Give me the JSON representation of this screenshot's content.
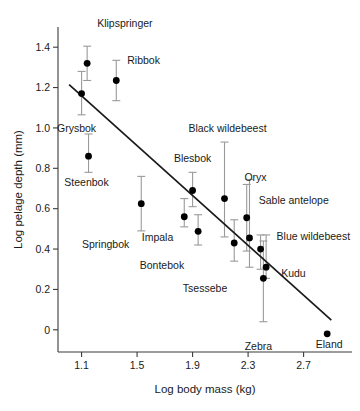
{
  "chart_data": {
    "type": "scatter",
    "title": "",
    "subtitle": "",
    "xlabel": "Log body mass (kg)",
    "ylabel": "Log pelage depth (mm)",
    "xlim": [
      0.93,
      3.02
    ],
    "ylim": [
      -0.11,
      1.5
    ],
    "xticks": [
      1.1,
      1.5,
      1.9,
      2.3,
      2.7
    ],
    "xtick_labels": [
      "1.1",
      "1.5",
      "1.9",
      "2.3",
      "2.7"
    ],
    "yticks": [
      0,
      0.2,
      0.4,
      0.6,
      0.8,
      1.0,
      1.2,
      1.4
    ],
    "ytick_labels": [
      "0",
      "0.2",
      "0.4",
      "0.6",
      "0.8",
      "1.0",
      "1.2",
      "1.4"
    ],
    "grid": false,
    "legend": "none",
    "error_bars": "vertical",
    "points": [
      {
        "label": "Klipspringer",
        "x": 1.14,
        "y": 1.32,
        "ylow": 1.235,
        "yhigh": 1.405,
        "label_dx": 10,
        "label_dy": -36,
        "label_anchor": "start"
      },
      {
        "label": "Grysbok",
        "x": 1.1,
        "y": 1.17,
        "ylow": 1.065,
        "yhigh": 1.28,
        "label_dx": -5,
        "label_dy": 38,
        "label_anchor": "middle"
      },
      {
        "label": "Ribbok",
        "x": 1.35,
        "y": 1.235,
        "ylow": 1.135,
        "yhigh": 1.335,
        "label_dx": 11,
        "label_dy": -16,
        "label_anchor": "start"
      },
      {
        "label": "Steenbok",
        "x": 1.15,
        "y": 0.86,
        "ylow": 0.78,
        "yhigh": 0.97,
        "label_dx": -2,
        "label_dy": 30,
        "label_anchor": "middle"
      },
      {
        "label": "Springbok",
        "x": 1.53,
        "y": 0.625,
        "ylow": 0.49,
        "yhigh": 0.76,
        "label_dx": -12,
        "label_dy": 44,
        "label_anchor": "end"
      },
      {
        "label": "Impala",
        "x": 1.84,
        "y": 0.56,
        "ylow": 0.51,
        "yhigh": 0.65,
        "label_dx": -11,
        "label_dy": 24,
        "label_anchor": "end"
      },
      {
        "label": "Blesbok",
        "x": 1.9,
        "y": 0.69,
        "ylow": 0.61,
        "yhigh": 0.78,
        "label_dx": 0,
        "label_dy": -29,
        "label_anchor": "middle"
      },
      {
        "label": "Bontebok",
        "x": 1.94,
        "y": 0.488,
        "ylow": 0.42,
        "yhigh": 0.57,
        "label_dx": -14,
        "label_dy": 38,
        "label_anchor": "end"
      },
      {
        "label": "Black wildebeest",
        "x": 2.13,
        "y": 0.65,
        "ylow": 0.46,
        "yhigh": 0.93,
        "label_dx": 3,
        "label_dy": -67,
        "label_anchor": "middle"
      },
      {
        "label": "Tsessebe",
        "x": 2.2,
        "y": 0.43,
        "ylow": 0.34,
        "yhigh": 0.545,
        "label_dx": -7,
        "label_dy": 49,
        "label_anchor": "end"
      },
      {
        "label": "Oryx",
        "x": 2.31,
        "y": 0.455,
        "ylow": 0.31,
        "yhigh": 0.745,
        "label_dx": 6,
        "label_dy": -57,
        "label_anchor": "middle"
      },
      {
        "label": "Sable antelope",
        "x": 2.29,
        "y": 0.555,
        "ylow": 0.39,
        "yhigh": 0.72,
        "label_dx": 12,
        "label_dy": -14,
        "label_anchor": "start"
      },
      {
        "label": "Blue wildebeest",
        "x": 2.39,
        "y": 0.4,
        "ylow": 0.3,
        "yhigh": 0.47,
        "label_dx": 16,
        "label_dy": -9,
        "label_anchor": "start"
      },
      {
        "label": "Kudu",
        "x": 2.43,
        "y": 0.31,
        "ylow": 0.255,
        "yhigh": 0.47,
        "label_dx": 15,
        "label_dy": 10,
        "label_anchor": "start"
      },
      {
        "label": "Zebra",
        "x": 2.41,
        "y": 0.255,
        "ylow": 0.04,
        "yhigh": 0.44,
        "label_dx": -5,
        "label_dy": 72,
        "label_anchor": "middle"
      },
      {
        "label": "Eland",
        "x": 2.87,
        "y": -0.02,
        "ylow": null,
        "yhigh": null,
        "label_dx": 2,
        "label_dy": 14,
        "label_anchor": "middle"
      }
    ],
    "fit_line": {
      "description": "least-squares regression line",
      "x_start": 1.01,
      "y_start": 1.215,
      "x_end": 2.9,
      "y_end": 0.048
    }
  }
}
